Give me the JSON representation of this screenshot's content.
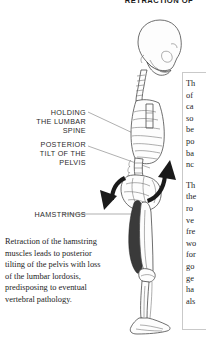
{
  "page": {
    "title": "RETRACTION OF",
    "background": "#ffffff",
    "ink": "#1a1a1a"
  },
  "callouts": [
    {
      "id": "holding-the-lumbar-spine",
      "text": "HOLDING\nTHE LUMBAR\nSPINE"
    },
    {
      "id": "posterior-tilt-of-the-pelvis",
      "text": "POSTERIOR\nTILT OF THE\nPELVIS"
    },
    {
      "id": "hamstrings",
      "text": "HAMSTRINGS"
    }
  ],
  "caption": {
    "text": "Retraction of the hamstring muscles leads to posterior tilting of the pelvis with loss of the lumbar lordosis, predisposing to eventual vertebral pathology."
  },
  "right_column": {
    "paragraph_1": "Th\nof\nca\nso\nbe\npo\nba\nnc",
    "paragraph_2": "Th\nthe\nro\nve\nfre\nwo\nfor\ngo\nge\nha\nals"
  },
  "figure": {
    "name": "lateral-skeleton-posterior-pelvic-tilt",
    "elements": [
      "skull-lateral",
      "cervical-spine",
      "thoracic-spine",
      "rib-cage",
      "sternum",
      "lumbar-spine",
      "pelvis",
      "femur",
      "tibia-fibula",
      "foot",
      "hamstring-muscle"
    ],
    "arrows": [
      {
        "name": "pelvic-rotation-arrow-up",
        "direction": "up",
        "color": "#1a1a1a"
      },
      {
        "name": "pelvic-rotation-arrow-down",
        "direction": "down",
        "color": "#1a1a1a"
      }
    ]
  }
}
